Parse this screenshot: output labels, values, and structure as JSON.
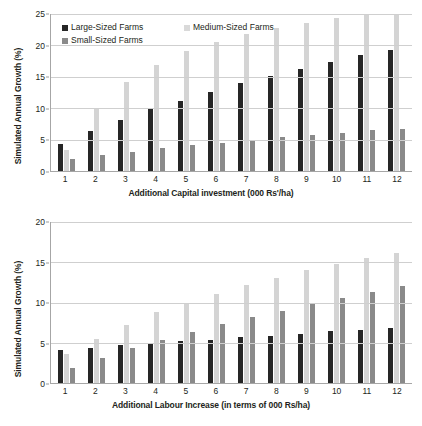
{
  "charts": [
    {
      "id": "capital",
      "ytitle": "Simulated Annual Growth (%)",
      "xtitle": "Additional Capital investment (000 Rs'/ha)",
      "legend": [
        {
          "label": "Large-Sized Farms",
          "key": "large"
        },
        {
          "label": "Medium-Sized Farms",
          "key": "medium"
        },
        {
          "label": "Small-Sized Farms",
          "key": "small"
        }
      ],
      "yticks": [
        0,
        5,
        10,
        15,
        20,
        25
      ]
    },
    {
      "id": "labour",
      "ytitle": "Simulated Annual Growth (%)",
      "xtitle": "Additional Labour Increase (in terms of 000 Rs/ha)",
      "legend": [
        {
          "label": "Large-Sized Farms",
          "key": "large"
        },
        {
          "label": "Medium-Sized Farms",
          "key": "medium"
        },
        {
          "label": "Small-Sized Farms",
          "key": "small"
        }
      ],
      "yticks": [
        0,
        5,
        10,
        15,
        20
      ]
    }
  ],
  "chart_data": [
    {
      "type": "bar",
      "title": "",
      "xlabel": "Additional Capital investment (000 Rs'/ha)",
      "ylabel": "Simulated Annual Growth (%)",
      "categories": [
        "1",
        "2",
        "3",
        "4",
        "5",
        "6",
        "7",
        "8",
        "9",
        "10",
        "11",
        "12"
      ],
      "ylim": [
        0,
        25
      ],
      "yticks": [
        0,
        5,
        10,
        15,
        20,
        25
      ],
      "grid": true,
      "legend_position": "top-left",
      "series": [
        {
          "name": "Large-Sized Farms",
          "values": [
            4.3,
            6.3,
            8.1,
            9.8,
            11.2,
            12.6,
            14.0,
            15.1,
            16.3,
            17.3,
            18.4,
            19.3
          ]
        },
        {
          "name": "Medium-Sized Farms",
          "values": [
            3.4,
            9.9,
            14.1,
            16.9,
            19.1,
            20.6,
            21.8,
            22.8,
            23.6,
            24.3,
            25.2,
            25.3
          ]
        },
        {
          "name": "Small-Sized Farms",
          "values": [
            1.9,
            2.5,
            3.1,
            3.6,
            4.1,
            4.5,
            5.0,
            5.4,
            5.7,
            6.1,
            6.5,
            6.7
          ]
        }
      ]
    },
    {
      "type": "bar",
      "title": "",
      "xlabel": "Additional Labour Increase (in terms of 000 Rs/ha)",
      "ylabel": "Simulated Annual Growth (%)",
      "categories": [
        "1",
        "2",
        "3",
        "4",
        "5",
        "6",
        "7",
        "8",
        "9",
        "10",
        "11",
        "12"
      ],
      "ylim": [
        0,
        20
      ],
      "yticks": [
        0,
        5,
        10,
        15,
        20
      ],
      "grid": true,
      "legend_position": "top-left",
      "series": [
        {
          "name": "Large-Sized Farms",
          "values": [
            4.1,
            4.4,
            4.7,
            4.9,
            5.2,
            5.4,
            5.7,
            5.9,
            6.1,
            6.4,
            6.6,
            6.8
          ]
        },
        {
          "name": "Medium-Sized Farms",
          "values": [
            3.6,
            5.5,
            7.2,
            8.8,
            9.9,
            11.1,
            12.2,
            13.1,
            14.0,
            14.8,
            15.5,
            16.1
          ]
        },
        {
          "name": "Small-Sized Farms",
          "values": [
            1.9,
            3.1,
            4.3,
            5.3,
            6.3,
            7.3,
            8.2,
            9.0,
            9.8,
            10.6,
            11.3,
            12.0
          ]
        }
      ]
    }
  ]
}
